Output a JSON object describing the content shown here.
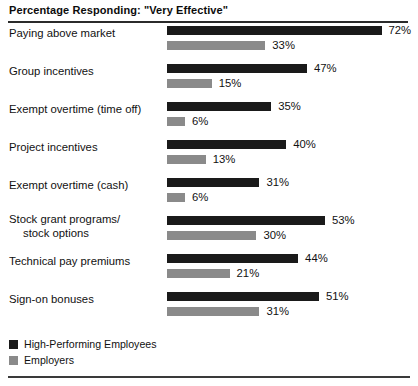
{
  "chart_data": {
    "type": "bar",
    "orientation": "horizontal",
    "title": "Percentage Responding: \"Very Effective\"",
    "xlabel": "",
    "ylabel": "",
    "xlim": [
      0,
      80
    ],
    "grid": false,
    "legend_position": "bottom-left",
    "value_suffix": "%",
    "categories": [
      "Paying above market",
      "Group incentives",
      "Exempt overtime (time off)",
      "Project incentives",
      "Exempt overtime (cash)",
      "Stock grant programs/ stock options",
      "Technical pay premiums",
      "Sign-on bonuses"
    ],
    "series": [
      {
        "name": "High-Performing Employees",
        "color": "#1a1a1a",
        "values": [
          72,
          47,
          35,
          40,
          31,
          53,
          44,
          51
        ],
        "labels": [
          "72%",
          "47%",
          "35%",
          "40%",
          "31%",
          "53%",
          "44%",
          "51%"
        ]
      },
      {
        "name": "Employers",
        "color": "#8a8a8a",
        "values": [
          33,
          15,
          6,
          13,
          6,
          30,
          21,
          31
        ],
        "labels": [
          "33%",
          "15%",
          "6%",
          "13%",
          "6%",
          "30%",
          "21%",
          "31%"
        ]
      }
    ]
  },
  "rows": [
    {
      "label_line1": "Paying above market",
      "label_line2": "",
      "primary_value": 72,
      "primary_label": "72%",
      "secondary_value": 33,
      "secondary_label": "33%"
    },
    {
      "label_line1": "Group incentives",
      "label_line2": "",
      "primary_value": 47,
      "primary_label": "47%",
      "secondary_value": 15,
      "secondary_label": "15%"
    },
    {
      "label_line1": "Exempt overtime (time off)",
      "label_line2": "",
      "primary_value": 35,
      "primary_label": "35%",
      "secondary_value": 6,
      "secondary_label": "6%"
    },
    {
      "label_line1": "Project incentives",
      "label_line2": "",
      "primary_value": 40,
      "primary_label": "40%",
      "secondary_value": 13,
      "secondary_label": "13%"
    },
    {
      "label_line1": "Exempt overtime (cash)",
      "label_line2": "",
      "primary_value": 31,
      "primary_label": "31%",
      "secondary_value": 6,
      "secondary_label": "6%"
    },
    {
      "label_line1": "Stock grant programs/",
      "label_line2": "stock options",
      "primary_value": 53,
      "primary_label": "53%",
      "secondary_value": 30,
      "secondary_label": "30%"
    },
    {
      "label_line1": "Technical pay premiums",
      "label_line2": "",
      "primary_value": 44,
      "primary_label": "44%",
      "secondary_value": 21,
      "secondary_label": "21%"
    },
    {
      "label_line1": "Sign-on bonuses",
      "label_line2": "",
      "primary_value": 51,
      "primary_label": "51%",
      "secondary_value": 31,
      "secondary_label": "31%"
    }
  ],
  "legend": {
    "items": [
      {
        "label": "High-Performing Employees",
        "color": "#1a1a1a",
        "swatch": "primary"
      },
      {
        "label": "Employers",
        "color": "#8a8a8a",
        "swatch": "secondary"
      }
    ]
  },
  "style": {
    "px_per_percent": 2.98,
    "bar_origin_x": 167,
    "primary_color": "#1a1a1a",
    "secondary_color": "#8a8a8a",
    "rule_color": "#2b2b2b"
  }
}
